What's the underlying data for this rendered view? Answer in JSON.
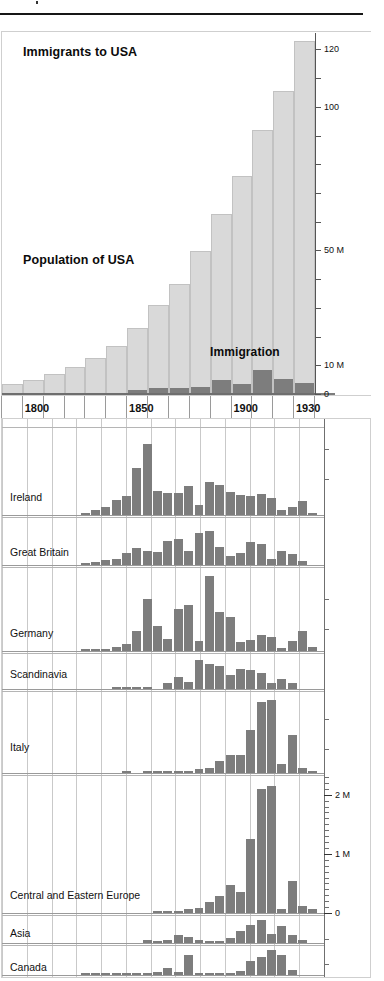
{
  "page": {
    "width": 384,
    "height": 981,
    "background": "#ffffff",
    "bar_light_color": "#d9d9d9",
    "bar_dark_color": "#7d7d7d",
    "gridline_color": "#c9c9c9"
  },
  "top_chart": {
    "labels": {
      "immigrants": "Immigrants to USA",
      "population": "Population of USA",
      "immigration": "Immigration"
    },
    "x_labels": [
      "1800",
      "1850",
      "1900",
      "1930"
    ],
    "y_labels": [
      "0",
      "10 M",
      "50 M",
      "100",
      "120"
    ]
  },
  "bottom_chart": {
    "title": "Country of origin of immigrants to USA",
    "panel_labels": [
      "Ireland",
      "Great Britain",
      "Germany",
      "Scandinavia",
      "Italy",
      "Central and Eastern Europe",
      "Asia",
      "Canada"
    ],
    "y_labels": [
      "0",
      "1 M",
      "2 M"
    ]
  },
  "chart_data": [
    {
      "type": "bar",
      "title": "Immigrants to USA / Population of USA",
      "xlabel": "",
      "ylabel": "",
      "ylim": [
        0,
        125
      ],
      "yticks": [
        0,
        10,
        20,
        30,
        40,
        50,
        60,
        70,
        80,
        90,
        100,
        110,
        120
      ],
      "ytick_labels": {
        "0": "0",
        "10": "10 M",
        "50": "50 M",
        "100": "100",
        "120": "120"
      },
      "grid": false,
      "categories": [
        1790,
        1800,
        1810,
        1820,
        1830,
        1840,
        1850,
        1860,
        1870,
        1880,
        1890,
        1900,
        1910,
        1920,
        1930
      ],
      "xticks": [
        1790,
        1800,
        1810,
        1820,
        1830,
        1840,
        1850,
        1860,
        1870,
        1880,
        1890,
        1900,
        1910,
        1920,
        1930
      ],
      "xtick_labels": {
        "1800": "1800",
        "1850": "1850",
        "1900": "1900",
        "1930": "1930"
      },
      "series": [
        {
          "name": "Population of USA",
          "units": "millions",
          "values": [
            3.9,
            5.3,
            7.2,
            9.6,
            12.9,
            17.1,
            23.2,
            31.4,
            38.6,
            50.2,
            62.9,
            76.2,
            92.2,
            106.0,
            123.2
          ]
        },
        {
          "name": "Immigration",
          "units": "millions per decade",
          "values": [
            0.0,
            0.0,
            0.0,
            0.0,
            0.15,
            0.6,
            1.7,
            2.6,
            2.3,
            2.8,
            5.2,
            3.7,
            8.8,
            5.7,
            4.1,
            0.5
          ]
        }
      ]
    },
    {
      "type": "bar",
      "title": "Country of origin of immigrants to USA",
      "xlabel": "",
      "ylabel": "",
      "ylim": [
        0,
        2.5
      ],
      "ytick_labels": {
        "0": "0",
        "1": "1 M",
        "2": "2 M"
      },
      "grid": true,
      "units": "millions per decade",
      "categories": [
        1820,
        1825,
        1830,
        1835,
        1840,
        1845,
        1850,
        1855,
        1860,
        1865,
        1870,
        1875,
        1880,
        1885,
        1890,
        1895,
        1900,
        1905,
        1910,
        1915,
        1920,
        1925,
        1930
      ],
      "series": [
        {
          "name": "Ireland",
          "values": [
            0.02,
            0.06,
            0.09,
            0.17,
            0.21,
            0.52,
            0.78,
            0.26,
            0.24,
            0.24,
            0.32,
            0.11,
            0.36,
            0.33,
            0.25,
            0.22,
            0.21,
            0.23,
            0.19,
            0.05,
            0.09,
            0.15,
            0.01
          ]
        },
        {
          "name": "Great Britain",
          "values": [
            0.01,
            0.03,
            0.05,
            0.06,
            0.13,
            0.18,
            0.15,
            0.14,
            0.25,
            0.27,
            0.15,
            0.33,
            0.35,
            0.19,
            0.09,
            0.13,
            0.24,
            0.22,
            0.06,
            0.15,
            0.11,
            0.04,
            0.0
          ]
        },
        {
          "name": "Germany",
          "values": [
            0.01,
            0.01,
            0.02,
            0.04,
            0.07,
            0.21,
            0.55,
            0.26,
            0.13,
            0.44,
            0.48,
            0.1,
            0.79,
            0.41,
            0.36,
            0.09,
            0.12,
            0.17,
            0.15,
            0.03,
            0.11,
            0.21,
            0.04
          ]
        },
        {
          "name": "Scandinavia",
          "values": [
            0.0,
            0.0,
            0.0,
            0.01,
            0.01,
            0.01,
            0.01,
            0.0,
            0.05,
            0.11,
            0.06,
            0.26,
            0.22,
            0.2,
            0.12,
            0.18,
            0.17,
            0.14,
            0.05,
            0.09,
            0.05,
            0.0,
            0.0
          ]
        },
        {
          "name": "Italy",
          "values": [
            0.0,
            0.0,
            0.0,
            0.0,
            0.01,
            0.0,
            0.01,
            0.01,
            0.01,
            0.01,
            0.02,
            0.04,
            0.06,
            0.13,
            0.2,
            0.2,
            0.47,
            0.78,
            0.8,
            0.1,
            0.42,
            0.06,
            0.02
          ]
        },
        {
          "name": "Central and Eastern Europe",
          "values": [
            0.0,
            0.0,
            0.0,
            0.0,
            0.0,
            0.0,
            0.0,
            0.03,
            0.03,
            0.02,
            0.07,
            0.09,
            0.19,
            0.29,
            0.47,
            0.35,
            1.25,
            2.1,
            2.15,
            0.07,
            0.54,
            0.12,
            0.07
          ]
        },
        {
          "name": "Asia",
          "values": [
            0.0,
            0.0,
            0.0,
            0.0,
            0.0,
            0.0,
            0.02,
            0.01,
            0.02,
            0.05,
            0.04,
            0.02,
            0.01,
            0.01,
            0.03,
            0.08,
            0.12,
            0.15,
            0.06,
            0.11,
            0.05,
            0.02,
            0.0
          ]
        },
        {
          "name": "Canada",
          "values": [
            0.01,
            0.01,
            0.01,
            0.01,
            0.01,
            0.01,
            0.02,
            0.05,
            0.11,
            0.05,
            0.3,
            0.02,
            0.02,
            0.02,
            0.02,
            0.06,
            0.21,
            0.27,
            0.38,
            0.3,
            0.07,
            0.0,
            0.0
          ]
        }
      ]
    }
  ]
}
